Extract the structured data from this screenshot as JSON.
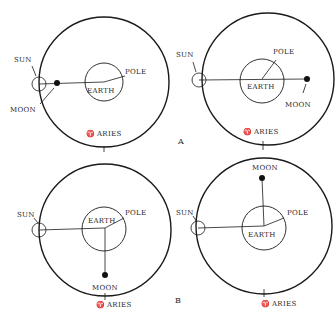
{
  "labels": {
    "sun": "SUN",
    "moon": "MOON",
    "earth": "EARTH",
    "pole": "POLE",
    "aries": "ARIES",
    "aries_symbol": "♈"
  },
  "panel_labels": {
    "a": "A",
    "b": "B"
  },
  "diagrams": [
    {
      "id": "top-left",
      "moon_phase_position": "between earth and sun (near sun)"
    },
    {
      "id": "top-right",
      "moon_phase_position": "opposite sun"
    },
    {
      "id": "bottom-left",
      "moon_phase_position": "toward Aries (bottom)"
    },
    {
      "id": "bottom-right",
      "moon_phase_position": "away from Aries (top)"
    }
  ],
  "colors": {
    "ink": "#1a1a1a",
    "background": "#ffffff"
  }
}
